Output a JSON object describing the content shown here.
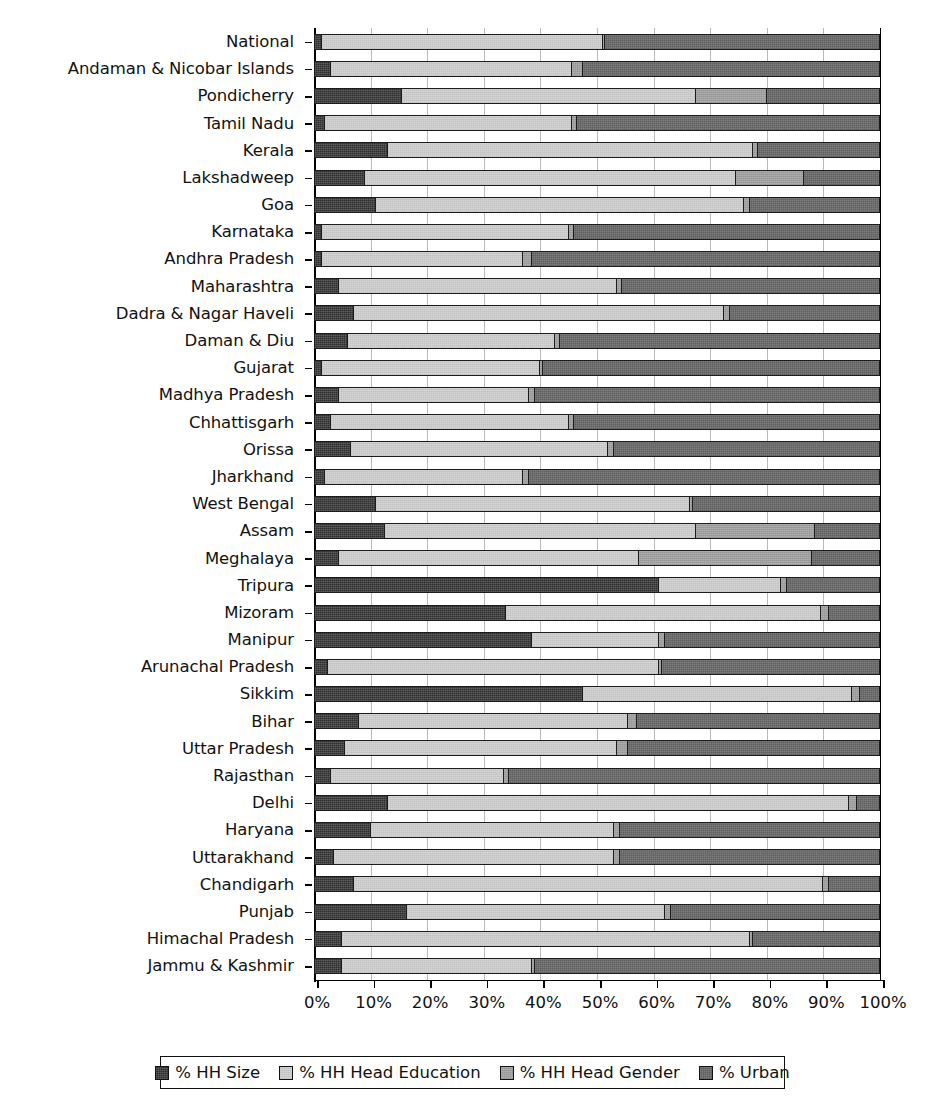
{
  "chart_data": {
    "type": "bar",
    "orientation": "horizontal",
    "stacked": true,
    "normalized_percent": true,
    "title": "",
    "subtitle": "",
    "xlabel": "",
    "ylabel": "",
    "xlim": [
      0,
      100
    ],
    "xticks": [
      0,
      10,
      20,
      30,
      40,
      50,
      60,
      70,
      80,
      90,
      100
    ],
    "xtick_labels": [
      "0%",
      "10%",
      "20%",
      "30%",
      "40%",
      "50%",
      "60%",
      "70%",
      "80%",
      "90%",
      "100%"
    ],
    "grid": true,
    "grid_axis": "x",
    "legend_position": "bottom",
    "legend": [
      "% HH Size",
      "% HH Head Education",
      "% HH Head Gender",
      "% Urban"
    ],
    "series_colors": [
      "#2e2e2e",
      "#d5d5d5",
      "#a6a6a6",
      "#6d6d6d"
    ],
    "categories": [
      "National",
      "Andaman & Nicobar Islands",
      "Pondicherry",
      "Tamil Nadu",
      "Kerala",
      "Lakshadweep",
      "Goa",
      "Karnataka",
      "Andhra Pradesh",
      "Maharashtra",
      "Dadra & Nagar Haveli",
      "Daman & Diu",
      "Gujarat",
      "Madhya Pradesh",
      "Chhattisgarh",
      "Orissa",
      "Jharkhand",
      "West Bengal",
      "Assam",
      "Meghalaya",
      "Tripura",
      "Mizoram",
      "Manipur",
      "Arunachal Pradesh",
      "Sikkim",
      "Bihar",
      "Uttar Pradesh",
      "Rajasthan",
      "Delhi",
      "Haryana",
      "Uttarakhand",
      "Chandigarh",
      "Punjab",
      "Himachal Pradesh",
      "Jammu & Kashmir"
    ],
    "series": [
      {
        "name": "% HH Size",
        "values": [
          1.5,
          3.0,
          15.5,
          2.0,
          13.0,
          9.0,
          11.0,
          1.5,
          1.5,
          4.5,
          7.0,
          6.0,
          1.5,
          4.5,
          3.0,
          6.5,
          2.0,
          11.0,
          12.5,
          4.5,
          61.0,
          34.0,
          38.5,
          2.5,
          47.5,
          8.0,
          5.5,
          3.0,
          13.0,
          10.0,
          3.5,
          7.0,
          16.5,
          5.0,
          5.0
        ]
      },
      {
        "name": "% HH Head Education",
        "values": [
          49.5,
          42.5,
          52.0,
          43.5,
          64.5,
          65.5,
          65.0,
          43.5,
          35.5,
          49.0,
          65.5,
          36.5,
          38.5,
          33.5,
          42.0,
          45.5,
          35.0,
          55.5,
          55.0,
          53.0,
          21.5,
          55.5,
          22.5,
          58.5,
          47.5,
          47.5,
          48.0,
          30.5,
          81.5,
          43.0,
          49.5,
          83.0,
          45.5,
          72.0,
          33.5
        ]
      },
      {
        "name": "% HH Head Gender",
        "values": [
          0.5,
          2.0,
          12.5,
          1.0,
          1.0,
          12.0,
          1.0,
          1.0,
          1.5,
          1.0,
          1.0,
          1.0,
          0.5,
          1.0,
          1.0,
          1.0,
          1.0,
          0.5,
          21.0,
          30.5,
          1.0,
          1.5,
          1.0,
          0.5,
          1.5,
          1.5,
          2.0,
          1.0,
          1.5,
          1.0,
          1.0,
          1.0,
          1.0,
          0.5,
          0.5
        ]
      },
      {
        "name": "% Urban",
        "values": [
          48.5,
          52.5,
          20.0,
          53.5,
          21.5,
          13.5,
          23.0,
          54.0,
          61.5,
          45.5,
          26.5,
          56.5,
          59.5,
          61.0,
          54.0,
          47.0,
          62.0,
          33.0,
          11.5,
          12.0,
          16.5,
          9.0,
          38.0,
          38.5,
          3.5,
          43.0,
          44.5,
          65.5,
          4.0,
          46.0,
          46.0,
          9.0,
          37.0,
          22.5,
          61.0
        ]
      }
    ]
  },
  "legend": {
    "items": [
      {
        "label": "% HH Size",
        "color": "#2e2e2e"
      },
      {
        "label": "% HH Head Education",
        "color": "#d5d5d5"
      },
      {
        "label": "% HH Head Gender",
        "color": "#a6a6a6"
      },
      {
        "label": "% Urban",
        "color": "#6d6d6d"
      }
    ]
  }
}
